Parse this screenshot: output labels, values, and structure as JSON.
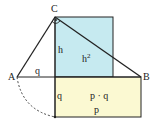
{
  "diagram": {
    "colors": {
      "square_fill": "#c6eaf0",
      "rect_fill": "#fbf9d2",
      "line": "#222222"
    },
    "points": {
      "A": {
        "label": "A",
        "x": 17,
        "y": 77
      },
      "B": {
        "label": "B",
        "x": 141,
        "y": 77
      },
      "C": {
        "label": "C",
        "x": 55,
        "y": 17
      }
    },
    "labels": {
      "h": "h",
      "h2": "h",
      "h2_sup": "2",
      "q_top": "q",
      "q_side": "q",
      "pq": "p · q",
      "p": "p"
    }
  }
}
